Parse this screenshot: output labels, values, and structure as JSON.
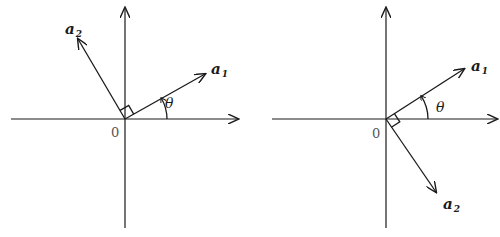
{
  "diagrams": [
    {
      "name": "left-panel",
      "origin_label": "0",
      "vector1": {
        "symbol": "a",
        "subscript": "1"
      },
      "vector2": {
        "symbol": "a",
        "subscript": "2"
      },
      "angle_label": "θ",
      "description": "a2 rotated 90° counterclockwise from a1"
    },
    {
      "name": "right-panel",
      "origin_label": "0",
      "vector1": {
        "symbol": "a",
        "subscript": "1"
      },
      "vector2": {
        "symbol": "a",
        "subscript": "2"
      },
      "angle_label": "θ",
      "description": "a2 rotated 90° clockwise from a1"
    }
  ],
  "colors": {
    "ink": "#1a1a1a",
    "background": "#ffffff"
  }
}
